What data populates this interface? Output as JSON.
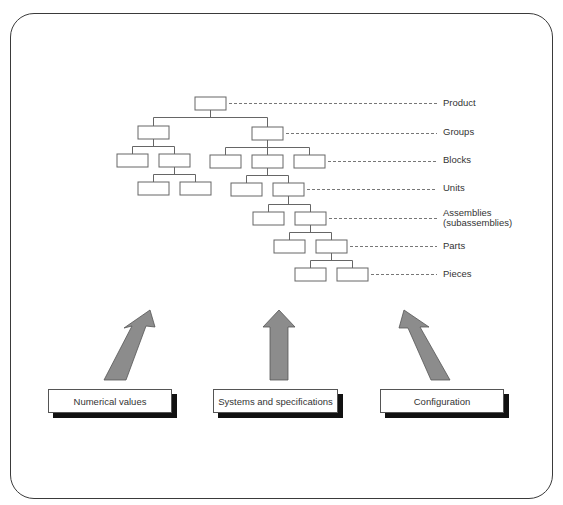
{
  "diagram": {
    "levels": [
      {
        "label": "Product",
        "y": 103
      },
      {
        "label": "Groups",
        "y": 132
      },
      {
        "label": "Blocks",
        "y": 160
      },
      {
        "label": "Units",
        "y": 188
      },
      {
        "label": "Assemblies\n(subassemblies)",
        "label_line1": "Assemblies",
        "label_line2": "(subassemblies)",
        "y": 218
      },
      {
        "label": "Parts",
        "y": 246
      },
      {
        "label": "Pieces",
        "y": 274
      }
    ],
    "sources": [
      {
        "label": "Numerical values"
      },
      {
        "label": "Systems and specifications"
      },
      {
        "label": "Configuration"
      }
    ],
    "colors": {
      "frame": "#3a3a3a",
      "box_stroke": "#666666",
      "arrow_fill": "#8c8c8c",
      "arrow_stroke": "#555555",
      "dash": "#777777",
      "shadow": "#111111"
    }
  }
}
